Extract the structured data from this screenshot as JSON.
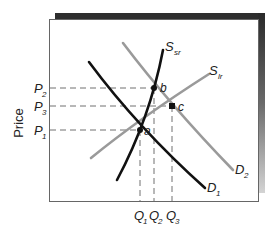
{
  "diagram": {
    "axis": {
      "y_label": "Price"
    },
    "price_levels": [
      {
        "id": "P2",
        "base": "P",
        "sub": "2",
        "y": 88
      },
      {
        "id": "P3",
        "base": "P",
        "sub": "3",
        "y": 106
      },
      {
        "id": "P1",
        "base": "P",
        "sub": "1",
        "y": 130
      }
    ],
    "quantity_levels": [
      {
        "id": "Q1",
        "base": "Q",
        "sub": "1",
        "x": 140
      },
      {
        "id": "Q2",
        "base": "Q",
        "sub": "2",
        "x": 154
      },
      {
        "id": "Q3",
        "base": "Q",
        "sub": "3",
        "x": 172
      }
    ],
    "points": [
      {
        "id": "a",
        "label": "a",
        "x": 140,
        "y": 130
      },
      {
        "id": "b",
        "label": "b",
        "x": 154,
        "y": 88
      },
      {
        "id": "c",
        "label": "c",
        "x": 172,
        "y": 106
      }
    ],
    "curves": [
      {
        "id": "D1",
        "base": "D",
        "sub": "1",
        "color": "#111111"
      },
      {
        "id": "D2",
        "base": "D",
        "sub": "2",
        "color": "#9a9a9a"
      },
      {
        "id": "Ssr",
        "base": "S",
        "sub": "sr",
        "color": "#111111"
      },
      {
        "id": "Slr",
        "base": "S",
        "sub": "lr",
        "color": "#9a9a9a"
      }
    ],
    "colors": {
      "dark_curve": "#111111",
      "light_curve": "#9a9a9a",
      "guide_line": "#666666",
      "frame": "#555555",
      "shadow": "#333333"
    }
  }
}
